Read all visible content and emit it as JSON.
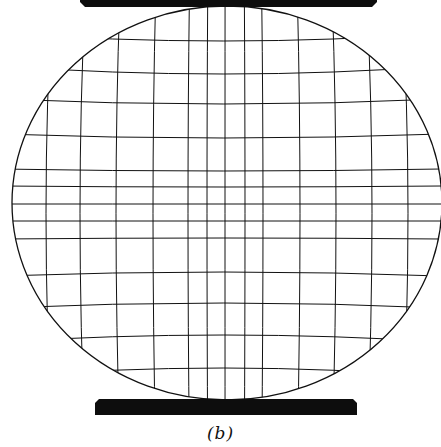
{
  "figure": {
    "caption": "(b)",
    "colors": {
      "ink": "#111111",
      "background": "#ffffff",
      "platen": "#0d0d0d"
    },
    "disc": {
      "cx": 227,
      "cy": 203,
      "rx": 215,
      "ry": 197
    },
    "top_platen": {
      "x1": 80,
      "x2": 377,
      "y_top": 0,
      "y_bottom": 7,
      "bevel": 5
    },
    "bottom_platen": {
      "x1": 95,
      "x2": 357,
      "y_top": 399,
      "y_bottom": 415,
      "bevel": 4
    },
    "vertical_lines_x": [
      46,
      80,
      116,
      153,
      188,
      207,
      225,
      245,
      263,
      300,
      336,
      372,
      408
    ],
    "horizontal_lines": [
      {
        "y_edge": 33,
        "y_center": 41
      },
      {
        "y_edge": 66,
        "y_center": 74
      },
      {
        "y_edge": 99,
        "y_center": 104
      },
      {
        "y_edge": 134,
        "y_center": 138
      },
      {
        "y_edge": 169,
        "y_center": 171
      },
      {
        "y_edge": 186,
        "y_center": 187
      },
      {
        "y_edge": 204,
        "y_center": 204
      },
      {
        "y_edge": 221,
        "y_center": 221
      },
      {
        "y_edge": 239,
        "y_center": 238
      },
      {
        "y_edge": 276,
        "y_center": 272
      },
      {
        "y_edge": 308,
        "y_center": 303
      },
      {
        "y_edge": 342,
        "y_center": 335
      },
      {
        "y_edge": 377,
        "y_center": 368
      }
    ]
  }
}
